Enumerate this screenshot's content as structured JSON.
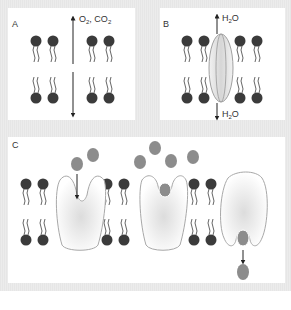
{
  "figure": {
    "panels": [
      {
        "id": "A",
        "label": "A",
        "description": "Simple diffusion of gases through the lipid bilayer",
        "molecules_label": "O2, CO2",
        "molecule_1": "O",
        "molecule_1_sub": "2",
        "separator": ", CO",
        "molecule_2_sub": "2"
      },
      {
        "id": "B",
        "label": "B",
        "description": "Water passing through a channel protein",
        "top_label_main": "H",
        "top_label_sub": "2",
        "top_label_tail": "O",
        "bottom_label_main": "H",
        "bottom_label_sub": "2",
        "bottom_label_tail": "O"
      },
      {
        "id": "C",
        "label": "C",
        "description": "Carrier protein conformational change transporting solute across membrane"
      }
    ],
    "colors": {
      "lipid_head": "#3b3b3b",
      "lipid_tail": "#555555",
      "solute": "#8c8c8c",
      "protein_outline": "#a8a8a8",
      "protein_fill": "#e2e2e2",
      "channel_fill": "#dcdcdc",
      "arrow": "#222222",
      "frame": "#e8e8e8"
    }
  }
}
